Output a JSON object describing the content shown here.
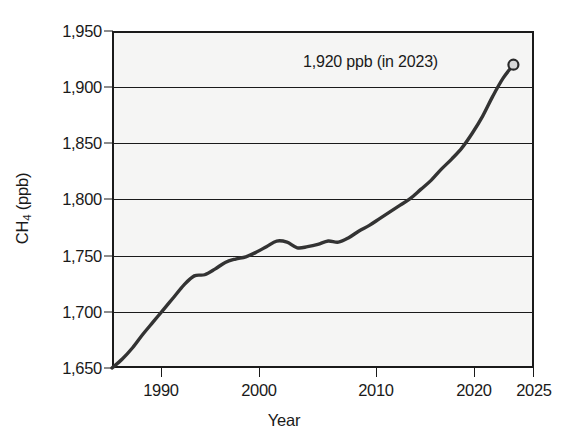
{
  "chart_data": {
    "type": "line",
    "title": "",
    "xlabel": "Year",
    "ylabel": "CH4 (ppb)",
    "ylabel_parts": {
      "prefix": "CH",
      "subscript": "4",
      "suffix": " (ppb)"
    },
    "xlim": [
      1984,
      2025
    ],
    "ylim": [
      1650,
      1950
    ],
    "grid": true,
    "legend": "none",
    "x_tick_labels": [
      "1990",
      "2000",
      "2010",
      "2020",
      "2025"
    ],
    "x_ticks": [
      1990,
      2000,
      2010,
      2020,
      2025
    ],
    "y_tick_labels": [
      "1,950",
      "1,900",
      "1,850",
      "1,800",
      "1,750",
      "1,700",
      "1,650"
    ],
    "y_ticks": [
      1950,
      1900,
      1850,
      1800,
      1750,
      1700,
      1650
    ],
    "series": [
      {
        "name": "CH4 concentration",
        "color": "#333333",
        "x": [
          1984,
          1985,
          1986,
          1987,
          1988,
          1989,
          1990,
          1991,
          1992,
          1993,
          1994,
          1995,
          1996,
          1997,
          1998,
          1999,
          2000,
          2001,
          2002,
          2003,
          2004,
          2005,
          2006,
          2007,
          2008,
          2009,
          2010,
          2011,
          2012,
          2013,
          2014,
          2015,
          2016,
          2017,
          2018,
          2019,
          2020,
          2021,
          2022,
          2023
        ],
        "values": [
          1650,
          1658,
          1668,
          1680,
          1691,
          1702,
          1713,
          1724,
          1732,
          1733,
          1738,
          1744,
          1747,
          1749,
          1753,
          1758,
          1763,
          1762,
          1757,
          1758,
          1760,
          1763,
          1762,
          1766,
          1772,
          1777,
          1783,
          1789,
          1795,
          1801,
          1809,
          1817,
          1827,
          1836,
          1846,
          1859,
          1874,
          1892,
          1908,
          1920
        ]
      }
    ],
    "annotations": [
      {
        "text": "1,920 ppb (in 2023)",
        "marker": "open-circle",
        "point_x": 2023,
        "point_y": 1920
      }
    ]
  },
  "axes": {
    "x_title": "Year",
    "y_title": "CH4 (ppb)"
  }
}
